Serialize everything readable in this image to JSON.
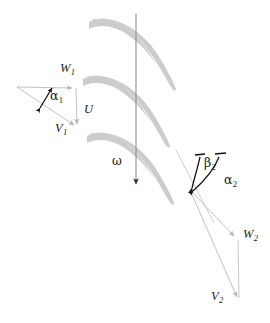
{
  "figure": {
    "width": 270,
    "height": 323,
    "background_color": "#ffffff"
  },
  "colors": {
    "blade_fill": "#c9c9c9",
    "vector_line": "#c0c0c0",
    "rotation_axis": "#8a8a8a",
    "angle_marker": "#111111",
    "label_text": "#1a1a1a"
  },
  "labels": {
    "w1": {
      "symbol": "W",
      "subscript": "1",
      "x": 60,
      "y": 69
    },
    "u": {
      "symbol": "U",
      "subscript": "",
      "x": 82,
      "y": 110
    },
    "v1": {
      "symbol": "V",
      "subscript": "1",
      "x": 57,
      "y": 128
    },
    "alpha1": {
      "symbol": "α",
      "subscript": "1",
      "x": 47,
      "y": 95
    },
    "omega": {
      "symbol": "ω",
      "subscript": "",
      "x": 114,
      "y": 160
    },
    "beta2": {
      "symbol": "β",
      "subscript": "2",
      "x": 203,
      "y": 160
    },
    "alpha2": {
      "symbol": "α",
      "subscript": "2",
      "x": 222,
      "y": 178
    },
    "w2": {
      "symbol": "W",
      "subscript": "2",
      "x": 243,
      "y": 232
    },
    "v2": {
      "symbol": "V",
      "subscript": "2",
      "x": 213,
      "y": 295
    }
  },
  "blades": {
    "count": 3,
    "description": "three curved cascade blades, blunt leading edge at left, thin trailing edge curving down-right",
    "paths": [
      "M 92,22 C 110,18 132,26 148,44 C 160,58 168,74 175,88 C 170,76 160,58 146,44 C 130,28 110,24 92,30 Z",
      "M 86,79 C 104,75 126,83 142,101 C 154,115 162,131 169,145 C 164,133 154,115 140,101 C 124,85 104,81 86,87 Z",
      "M 90,136 C 108,132 130,140 146,158 C 158,172 166,188 173,202 C 168,190 158,172 144,158 C 128,142 108,138 90,144 Z"
    ]
  },
  "inlet_triangle": {
    "apex_x": 17,
    "apex_y": 87,
    "w1_tip_x": 76,
    "w1_tip_y": 88,
    "v1_tip_x": 78,
    "v1_tip_y": 128,
    "description": "inlet velocity triangle: W1 horizontal, U vertical, V1 hypotenuse"
  },
  "rotation_arrow": {
    "x": 136,
    "y_start": 14,
    "y_end": 188,
    "description": "vertical rotation direction arrow labelled omega"
  },
  "outlet_vectors": {
    "vertex_x": 190,
    "vertex_y": 190,
    "w2_tip_x": 238,
    "w2_tip_y": 240,
    "v2_tip_x": 240,
    "v2_tip_y": 301,
    "blade_line_start_x": 178,
    "blade_line_start_y": 152,
    "description": "outlet vectors W2 and V2 from common vertex with vertical connector"
  },
  "angle_markers": {
    "alpha1": "double-headed straight arrow between W1 and V1 directions",
    "beta2": "curved double-headed arrow between blade tangent and vertical",
    "alpha2": "larger curved double-headed arrow between V2 and vertical"
  }
}
